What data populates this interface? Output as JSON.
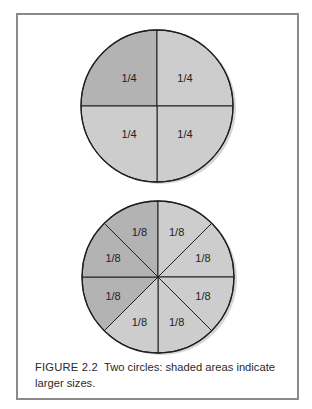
{
  "figure": {
    "label": "FIGURE 2.2",
    "caption": "Two circles: shaded areas indicate larger sizes.",
    "colors": {
      "dark": "#b3b3b3",
      "light": "#cdcdcd",
      "stroke": "#1e1e1e"
    },
    "circles": [
      {
        "name": "quarters-circle",
        "slices": [
          {
            "label": "1/4",
            "shaded": true
          },
          {
            "label": "1/4",
            "shaded": false
          },
          {
            "label": "1/4",
            "shaded": false
          },
          {
            "label": "1/4",
            "shaded": false
          }
        ]
      },
      {
        "name": "eighths-circle",
        "slices": [
          {
            "label": "1/8",
            "shaded": true
          },
          {
            "label": "1/8",
            "shaded": false
          },
          {
            "label": "1/8",
            "shaded": false
          },
          {
            "label": "1/8",
            "shaded": false
          },
          {
            "label": "1/8",
            "shaded": false
          },
          {
            "label": "1/8",
            "shaded": false
          },
          {
            "label": "1/8",
            "shaded": true
          },
          {
            "label": "1/8",
            "shaded": true
          }
        ]
      }
    ]
  }
}
